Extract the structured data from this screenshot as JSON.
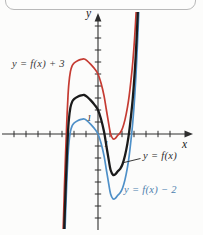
{
  "page": {
    "background": "#fcfcfb"
  },
  "chart_data": {
    "type": "line",
    "title": "",
    "xlabel": "x",
    "ylabel": "y",
    "x_tick_label": "1",
    "y_tick_label": "1",
    "labeled_tick_values": {
      "x": 1,
      "y": 1
    },
    "xlim": [
      -8,
      7.9
    ],
    "ylim": [
      -8.4,
      10.1
    ],
    "grid": false,
    "legend_position": "none",
    "unit_px": 12,
    "origin_px": [
      98,
      134
    ],
    "x_tick_range": [
      -7,
      6
    ],
    "y_tick_range": [
      -7,
      9
    ],
    "axis_color": "#2e2e2e",
    "series": [
      {
        "name": "y = f(x) + 3",
        "shift": 3,
        "color": "#c53b32",
        "label_color": "#3a3a3a",
        "stroke_width": 1.7
      },
      {
        "name": "y = f(x)",
        "shift": 0,
        "color": "#1b1b1b",
        "label_color": "#2b2b2b",
        "stroke_width": 2.3
      },
      {
        "name": "y = f(x) − 2",
        "shift": -2,
        "color": "#4e90c8",
        "label_color": "#4c7fae",
        "stroke_width": 1.7
      }
    ],
    "base_curve_points": [
      [
        -2.95,
        -12.5
      ],
      [
        -2.87,
        -9.8
      ],
      [
        -2.79,
        -7.2
      ],
      [
        -2.7,
        -4.6
      ],
      [
        -2.61,
        -2.2
      ],
      [
        -2.52,
        -0.2
      ],
      [
        -2.42,
        1.3
      ],
      [
        -2.3,
        2.2
      ],
      [
        -2.15,
        2.7
      ],
      [
        -2.0,
        2.9
      ],
      [
        -1.7,
        3.1
      ],
      [
        -1.4,
        3.22
      ],
      [
        -1.15,
        3.25
      ],
      [
        -0.9,
        3.1
      ],
      [
        -0.6,
        2.8
      ],
      [
        -0.3,
        2.45
      ],
      [
        0.0,
        2.0
      ],
      [
        0.25,
        1.25
      ],
      [
        0.5,
        0.2
      ],
      [
        0.7,
        -1.0
      ],
      [
        0.9,
        -2.2
      ],
      [
        1.05,
        -3.0
      ],
      [
        1.25,
        -3.4
      ],
      [
        1.45,
        -3.35
      ],
      [
        1.65,
        -3.1
      ],
      [
        1.85,
        -2.9
      ],
      [
        2.05,
        -2.5
      ],
      [
        2.25,
        -1.8
      ],
      [
        2.45,
        -0.8
      ],
      [
        2.6,
        0.2
      ],
      [
        2.75,
        1.5
      ],
      [
        2.9,
        3.0
      ],
      [
        3.05,
        5.0
      ],
      [
        3.2,
        7.6
      ],
      [
        3.32,
        10.2
      ],
      [
        3.45,
        13.5
      ]
    ],
    "annotation_leader": {
      "from_px": [
        140.5,
        158.5
      ],
      "to_px": [
        124,
        162.5
      ]
    }
  }
}
